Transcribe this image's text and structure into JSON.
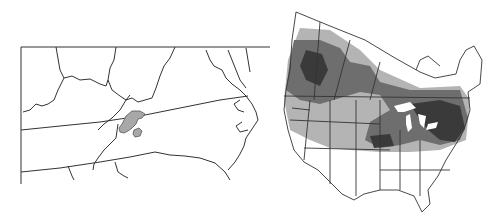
{
  "figure": {
    "panels": [
      {
        "id": "left",
        "description": "Regional map of Virginia/North Carolina/Tennessee/Kentucky area with small shaded range region",
        "fill_color": "#a8a8a8",
        "line_color": "#333333"
      },
      {
        "id": "right",
        "description": "Map of United States and southern Canada with distribution shading",
        "shades": {
          "dark": "#3a3a3a",
          "medium": "#6e6e6e",
          "light": "#b4b4b4"
        },
        "line_color": "#333333"
      }
    ]
  }
}
